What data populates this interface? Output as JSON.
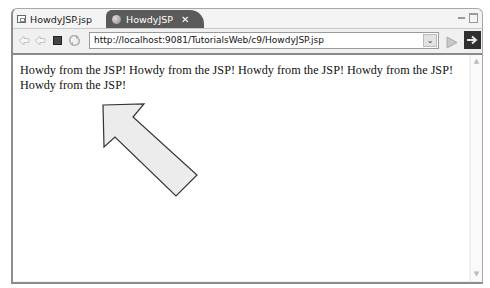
{
  "tabs": [
    {
      "label": "HowdyJSP.jsp",
      "active": false,
      "icon": "jsp-file-icon"
    },
    {
      "label": "HowdyJSP",
      "active": true,
      "icon": "web-browser-icon",
      "close": "✕"
    }
  ],
  "window_controls": {
    "minimize": "minimize-icon",
    "maximize": "maximize-icon"
  },
  "toolbar": {
    "back": "back-arrow-icon",
    "forward": "forward-arrow-icon",
    "stop": "stop-icon",
    "refresh": "refresh-icon",
    "url": "http://localhost:9081/TutorialsWeb/c9/HowdyJSP.jsp",
    "dropdown_glyph": "⌄",
    "go": "go-icon"
  },
  "content": {
    "text": "Howdy from the JSP! Howdy from the JSP! Howdy from the JSP! Howdy from the JSP! Howdy from the JSP!"
  },
  "annotation": {
    "type": "arrow",
    "fill": "#ececec",
    "stroke": "#333333"
  },
  "colors": {
    "active_tab": "#5a5a5a",
    "border": "#8c8c8c",
    "toolbar": "#f0f0f0"
  }
}
